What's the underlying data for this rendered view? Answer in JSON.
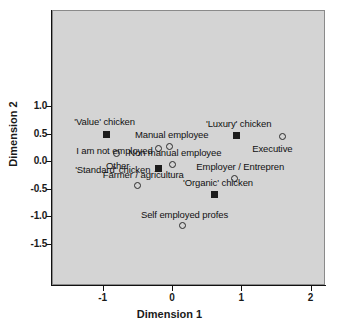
{
  "chart_data": {
    "type": "scatter",
    "title": "",
    "xlabel": "Dimension 1",
    "ylabel": "Dimension 2",
    "xlim": [
      -1.65,
      2.3
    ],
    "ylim": [
      -1.5,
      1.48
    ],
    "xticks": [
      "-1",
      "0",
      "1",
      "2"
    ],
    "xtick_values": [
      -1,
      0,
      1,
      2
    ],
    "yticks": [
      "1.0",
      "0.5",
      "0.0",
      "-0.5",
      "-1.0",
      "-1.5"
    ],
    "ytick_values": [
      1.0,
      0.5,
      0.0,
      -0.5,
      -1.0,
      -1.5
    ],
    "grid": false,
    "legend": "none",
    "panel_color": "#d4d4d4",
    "series": [
      {
        "name": "Chicken product",
        "marker": "filled-square",
        "points": [
          {
            "label": "'Value' chicken",
            "x": -0.94,
            "y": 0.49,
            "label_dx": -2,
            "label_dy": -13,
            "label_align": "center"
          },
          {
            "label": "'Luxury' chicken",
            "x": 0.93,
            "y": 0.46,
            "label_dx": 2,
            "label_dy": -13,
            "label_align": "center"
          },
          {
            "label": "'Standard' chicken",
            "x": -0.2,
            "y": -0.14,
            "label_dx": -8,
            "label_dy": 0,
            "label_align": "right"
          },
          {
            "label": "'Organic' chicken",
            "x": 0.62,
            "y": -0.6,
            "label_dx": 3,
            "label_dy": -12,
            "label_align": "center"
          }
        ]
      },
      {
        "name": "Occupation",
        "marker": "open-circle",
        "points": [
          {
            "label": "Executive",
            "x": 1.59,
            "y": 0.44,
            "label_dx": -10,
            "label_dy": 11,
            "label_align": "center"
          },
          {
            "label": "Manual employee",
            "x": -0.03,
            "y": 0.27,
            "label_dx": 2,
            "label_dy": -12,
            "label_align": "center"
          },
          {
            "label": "I am not employed",
            "x": -0.2,
            "y": 0.22,
            "label_dx": -6,
            "label_dy": 1,
            "label_align": "right"
          },
          {
            "label": "Other",
            "x": -0.8,
            "y": 0.13,
            "label_dx": 1,
            "label_dy": 11,
            "label_align": "center"
          },
          {
            "label": "Non manual employee",
            "x": 0.01,
            "y": -0.06,
            "label_dx": 2,
            "label_dy": -12,
            "label_align": "center"
          },
          {
            "label": "Employer /  Entrepren",
            "x": 0.9,
            "y": -0.31,
            "label_dx": 6,
            "label_dy": -12,
            "label_align": "center"
          },
          {
            "label": "Farmer / agricultura",
            "x": -0.5,
            "y": -0.45,
            "label_dx": 6,
            "label_dy": -12,
            "label_align": "center"
          },
          {
            "label": "Self employed profes",
            "x": 0.15,
            "y": -1.18,
            "label_dx": 2,
            "label_dy": -12,
            "label_align": "center"
          }
        ]
      }
    ]
  },
  "axes": {
    "x_title": "Dimension 1",
    "y_title": "Dimension 2"
  }
}
